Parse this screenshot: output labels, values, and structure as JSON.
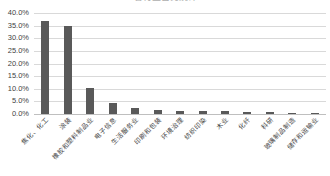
{
  "chart_data": {
    "type": "bar",
    "title": "各行业占比统计",
    "xlabel": "",
    "ylabel": "",
    "ylim": [
      0,
      40
    ],
    "ytick_labels": [
      "40.0%",
      "35.0%",
      "30.0%",
      "25.0%",
      "20.0%",
      "15.0%",
      "10.0%",
      "5.0%",
      "0.0%"
    ],
    "ytick_values": [
      40,
      35,
      30,
      25,
      20,
      15,
      10,
      5,
      0
    ],
    "grid": true,
    "legend": false,
    "bar_color": "#595959",
    "categories": [
      "焦化、化工",
      "涂装",
      "橡胶和塑料制品业",
      "电子信息",
      "生活服务业",
      "印刷和包装",
      "环境治理",
      "纺织印染",
      "木业",
      "化纤",
      "科研",
      "玻璃制品制造",
      "储存和运输业"
    ],
    "values": [
      36.8,
      35.0,
      10.5,
      4.5,
      2.3,
      1.4,
      1.3,
      1.2,
      1.0,
      0.9,
      0.8,
      0.4,
      0.3
    ]
  }
}
